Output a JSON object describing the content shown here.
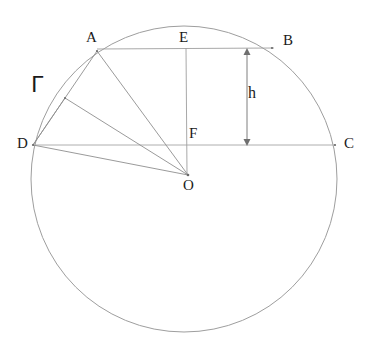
{
  "figure": {
    "background_color": "#ffffff",
    "stroke_color": "#8a8a8a",
    "label_color": "#1a1a1a"
  },
  "circle": {
    "name": "Gamma",
    "label": "Γ",
    "label_x": 31,
    "label_y": 74,
    "center_x": 184,
    "center_y": 179,
    "radius": 153,
    "stroke": "#9a9a9a",
    "stroke_width": 1
  },
  "points": [
    {
      "id": "A",
      "label": "A",
      "x": 97,
      "y": 51,
      "label_x": 86,
      "label_y": 30
    },
    {
      "id": "B",
      "label": "B",
      "x": 272,
      "y": 48,
      "label_x": 283,
      "label_y": 33
    },
    {
      "id": "C",
      "label": "C",
      "x": 335,
      "y": 145,
      "label_x": 344,
      "label_y": 136
    },
    {
      "id": "D",
      "label": "D",
      "x": 33,
      "y": 145,
      "label_x": 17,
      "label_y": 136
    },
    {
      "id": "E",
      "label": "E",
      "x": 186,
      "y": 48,
      "label_x": 179,
      "label_y": 30
    },
    {
      "id": "F",
      "label": "F",
      "x": 186,
      "y": 145,
      "label_x": 189,
      "label_y": 126
    },
    {
      "id": "O",
      "label": "O",
      "x": 188,
      "y": 175,
      "label_x": 183,
      "label_y": 178
    },
    {
      "id": "P",
      "label": "",
      "x": 65,
      "y": 98,
      "label_x": 0,
      "label_y": 0
    }
  ],
  "segments": [
    {
      "name": "chord-AB",
      "x1": 97,
      "y1": 49,
      "x2": 274,
      "y2": 48
    },
    {
      "name": "diameter-DC",
      "x1": 33,
      "y1": 145,
      "x2": 335,
      "y2": 145
    },
    {
      "name": "segment-EF",
      "x1": 186,
      "y1": 48,
      "x2": 187,
      "y2": 173
    },
    {
      "name": "radius-OA",
      "x1": 188,
      "y1": 175,
      "x2": 97,
      "y2": 51
    },
    {
      "name": "radius-OD",
      "x1": 188,
      "y1": 175,
      "x2": 33,
      "y2": 145
    },
    {
      "name": "radius-OP",
      "x1": 188,
      "y1": 175,
      "x2": 65,
      "y2": 98
    },
    {
      "name": "chord-DA",
      "x1": 33,
      "y1": 145,
      "x2": 97,
      "y2": 51
    },
    {
      "name": "chord-DP",
      "x1": 33,
      "y1": 145,
      "x2": 65,
      "y2": 98
    }
  ],
  "measurement": {
    "name": "height-h",
    "label": "h",
    "label_x": 248,
    "label_y": 85,
    "line_x": 247,
    "top_y": 50,
    "bottom_y": 144,
    "arrow_size": 4
  }
}
